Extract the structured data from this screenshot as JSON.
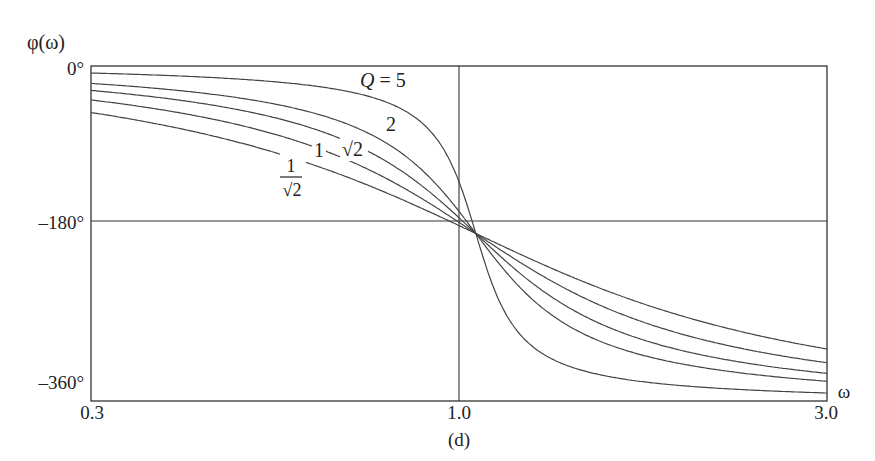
{
  "chart_data": {
    "type": "line",
    "title": "",
    "caption": "(d)",
    "xlabel": "ω",
    "ylabel": "φ(ω)",
    "xscale": "log",
    "xlim": [
      0.3,
      3.0
    ],
    "ylim": [
      -360,
      0
    ],
    "x_ticks": [
      "0.3",
      "1.0",
      "3.0"
    ],
    "y_ticks": [
      "0°",
      "–180°",
      "–360°"
    ],
    "grid": {
      "vertical_at_x": 1.0,
      "horizontal_at_y": -180
    },
    "legend": "inline curve labels",
    "annotations": [
      "Q = 5",
      "2",
      "√2",
      "1",
      "1/√2"
    ],
    "x": [
      0.3,
      0.5,
      0.7,
      0.9,
      1.0,
      1.1,
      1.5,
      2.0,
      3.0
    ],
    "series": [
      {
        "name": "Q = 5",
        "Q": 5.0,
        "values": [
          -3.8,
          -7.6,
          -15.3,
          -43.5,
          -180,
          -133.6,
          -173.2,
          -175.2,
          -176.4
        ]
      },
      {
        "name": "Q = 2",
        "Q": 2.0,
        "values": [
          -9.4,
          -18.4,
          -34.5,
          -67.1,
          -180,
          -117.8,
          -163.3,
          -167.5,
          -170.8
        ]
      },
      {
        "name": "Q = √2",
        "Q": 1.4142,
        "values": [
          -13.1,
          -25.2,
          -44.2,
          -73.4,
          -180,
          -112.1,
          -157.1,
          -162.6,
          -167.0
        ]
      },
      {
        "name": "Q = 1",
        "Q": 1.0,
        "values": [
          -18.2,
          -33.7,
          -53.9,
          -78.1,
          -180,
          -107.7,
          -148.7,
          -153.4,
          -159.4
        ]
      },
      {
        "name": "Q = 1/√2",
        "Q": 0.7071,
        "values": [
          -25.0,
          -43.3,
          -64.0,
          -81.7,
          -180,
          -105.3,
          -140.4,
          -143.1,
          -150.1
        ]
      }
    ]
  },
  "labels": {
    "ylabel": "φ(ω)",
    "xlabel": "ω",
    "y0": "0°",
    "y180": "–180°",
    "y360": "–360°",
    "x03": "0.3",
    "x10": "1.0",
    "x30": "3.0",
    "caption": "(d)",
    "q5": "Q = 5",
    "q2": "2",
    "qsqrt2": "√2",
    "q1": "1",
    "qinv_num": "1",
    "qinv_den": "√2"
  }
}
